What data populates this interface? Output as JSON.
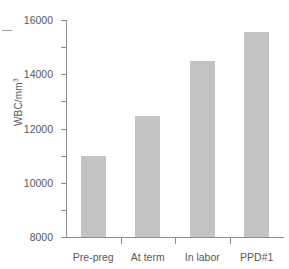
{
  "chart_data": {
    "type": "bar",
    "title": "",
    "xlabel": "",
    "ylabel": "WBC/mm",
    "ylabel_superscript": "3",
    "categories": [
      "Pre-preg",
      "At term",
      "In labor",
      "PPD#1"
    ],
    "values": [
      5950,
      8900,
      13000,
      15100
    ],
    "ylim": [
      0,
      16000
    ],
    "ytick_labels": [
      "16000",
      "14000",
      "12000",
      "10000",
      "8000",
      "6000",
      "4000",
      "2000",
      "0"
    ],
    "ytick_values": [
      16000,
      14000,
      12000,
      10000,
      8000,
      6000,
      4000,
      2000,
      0
    ],
    "grid": false,
    "legend": "none",
    "bar_color": "#c2c3c4",
    "axis_color": "#8c8c8c",
    "text_color": "#58595b",
    "background": "#ffffff"
  }
}
